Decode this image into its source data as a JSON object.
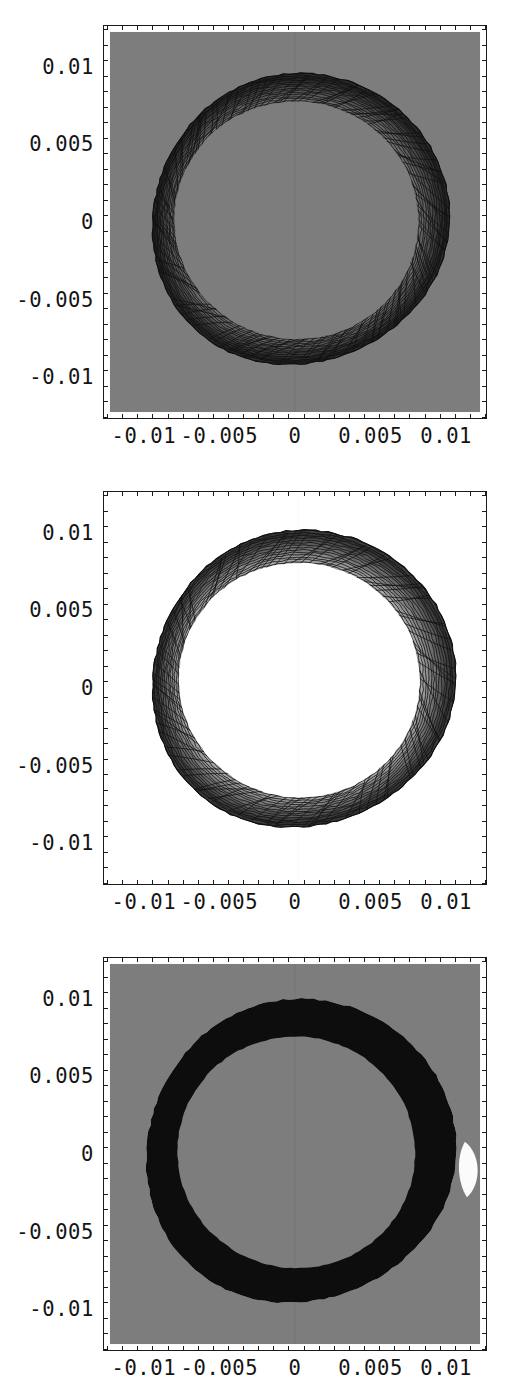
{
  "figure": {
    "panel_count": 3,
    "width": 513,
    "height": 1399
  },
  "axis": {
    "x_tick_labels": [
      "-0.01",
      "-0.005",
      "0",
      "0.005",
      "0.01"
    ],
    "x_tick_values": [
      -0.01,
      -0.005,
      0,
      0.005,
      0.01
    ],
    "y_tick_labels": [
      "0.01",
      "0.005",
      "0",
      "-0.005",
      "-0.01"
    ],
    "y_tick_values": [
      0.01,
      0.005,
      0,
      -0.005,
      -0.01
    ],
    "xlim": [
      -0.0127,
      0.0127
    ],
    "ylim": [
      -0.0127,
      0.0127
    ],
    "minor_ticks_per_interval": 5
  },
  "colors": {
    "background_gray": "#7d7d7d",
    "background_white": "#ffffff",
    "contour_dark": "#171717",
    "mid_gray": "#6a6a6a",
    "light_gray": "#9a9a9a",
    "frame": "#1b1b1b",
    "label_text": "#141414"
  },
  "chart_data": [
    {
      "id": "panel-top",
      "type": "contour",
      "title": "",
      "xlabel": "",
      "ylabel": "",
      "xlim": [
        -0.0127,
        0.0127
      ],
      "ylim": [
        -0.0127,
        0.0127
      ],
      "x_ticks": [
        -0.01,
        -0.005,
        0,
        0.005,
        0.01
      ],
      "y_ticks": [
        -0.01,
        -0.005,
        0,
        0.005,
        0.01
      ],
      "grid": false,
      "legend": "none",
      "background_fill": "#7d7d7d",
      "description": "Annular contour band centered at origin; dense radial contour lines fill the annulus; background uniformly mid-gray",
      "annulus": {
        "center": [
          0.0,
          0.0
        ],
        "inner_radius": 0.008,
        "outer_radius": 0.0098,
        "radius_variation": 0.0012
      },
      "contour_line_count": 120,
      "fill_levels": [
        "#7d7d7d",
        "#6f6f6f",
        "#5e5e5e",
        "#4a4a4a",
        "#2e2e2e",
        "#171717"
      ]
    },
    {
      "id": "panel-middle",
      "type": "contour",
      "title": "",
      "xlabel": "",
      "ylabel": "",
      "xlim": [
        -0.0127,
        0.0127
      ],
      "ylim": [
        -0.0127,
        0.0127
      ],
      "x_ticks": [
        -0.01,
        -0.005,
        0,
        0.005,
        0.01
      ],
      "y_ticks": [
        -0.01,
        -0.005,
        0,
        0.005,
        0.01
      ],
      "grid": false,
      "legend": "none",
      "background_fill": "#ffffff",
      "description": "Annular contour band on white background; dark band outline with gray interior shading and thin contour lines; interior and exterior both white",
      "annulus": {
        "center": [
          0.0002,
          0.0004
        ],
        "inner_radius": 0.0079,
        "outer_radius": 0.01,
        "radius_variation": 0.001
      },
      "contour_line_count": 90,
      "fill_levels": [
        "#ffffff",
        "#b4b4b4",
        "#8d8d8d",
        "#6b6b6b",
        "#3a3a3a",
        "#141414"
      ]
    },
    {
      "id": "panel-bottom",
      "type": "contour",
      "title": "",
      "xlabel": "",
      "ylabel": "",
      "xlim": [
        -0.0127,
        0.0127
      ],
      "ylim": [
        -0.0127,
        0.0127
      ],
      "x_ticks": [
        -0.01,
        -0.005,
        0,
        0.005,
        0.01
      ],
      "y_ticks": [
        -0.01,
        -0.005,
        0,
        0.005,
        0.01
      ],
      "grid": false,
      "legend": "none",
      "background_fill": "#7d7d7d",
      "description": "Solid black annulus on mid-gray background; small white lens-shaped region on the right side of the ring near y=-0.001, x=+0.0113",
      "annulus": {
        "center": [
          0.0,
          0.0
        ],
        "inner_radius": 0.0078,
        "outer_radius": 0.0102,
        "radius_variation": 0.0009
      },
      "white_lens": {
        "center": [
          0.0113,
          -0.001
        ],
        "width": 0.0013,
        "height": 0.0036
      },
      "contour_line_count": 2,
      "fill_levels": [
        "#7d7d7d",
        "#0d0d0d",
        "#ffffff"
      ]
    }
  ]
}
